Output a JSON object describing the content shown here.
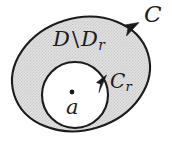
{
  "figure": {
    "background_color": "#ffffff",
    "stroke_color": "#1b1b1b",
    "fill_color": "#d9d9d9",
    "hole_fill_color": "#ffffff",
    "labels": {
      "region": {
        "main": "D",
        "operator": "\\",
        "second": "D",
        "second_subscript": "r"
      },
      "outer_curve": "C",
      "inner_curve": {
        "main": "C",
        "subscript": "r"
      },
      "center_point": "a"
    },
    "elements": {
      "outer_contour_name": "C",
      "inner_contour_name": "Cr",
      "shaded_region_name": "D \\ Dr",
      "marked_point_name": "a",
      "outer_arrow_direction": "counterclockwise",
      "inner_arrow_direction": "counterclockwise"
    },
    "geometry": {
      "outer_ellipse": {
        "cx": 81,
        "cy": 74,
        "rx": 70,
        "ry": 56,
        "rotation_deg": -17
      },
      "inner_circle": {
        "cx": 75,
        "cy": 95,
        "r": 33
      },
      "center_dot": {
        "cx": 72,
        "cy": 92,
        "r": 2.3
      },
      "outer_arrow_at": {
        "x": 133,
        "y": 31
      },
      "inner_arrow_at": {
        "x": 104,
        "y": 85
      }
    }
  }
}
